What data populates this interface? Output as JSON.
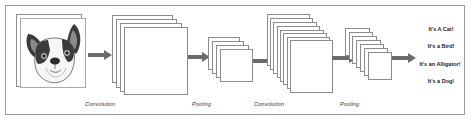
{
  "diagram": {
    "input": {
      "icon": "french-bulldog-face-icon",
      "description": "Input image of a dog"
    },
    "stages": [
      {
        "id": "conv1",
        "label": "Convolution",
        "feature_maps": 4
      },
      {
        "id": "pool1",
        "label": "Pooling",
        "feature_maps": 4
      },
      {
        "id": "conv2",
        "label": "Convolution",
        "feature_maps": 8
      },
      {
        "id": "pool2",
        "label": "Pooling",
        "feature_maps": 7
      }
    ],
    "outputs": [
      "It's A Cat!",
      "It's a Bird!",
      "It's an Alligator!",
      "It's a Dog!"
    ],
    "colors": {
      "arrow": "#6b6b6b",
      "border": "#8c8c8c",
      "frame": "#9a9a9a"
    }
  }
}
